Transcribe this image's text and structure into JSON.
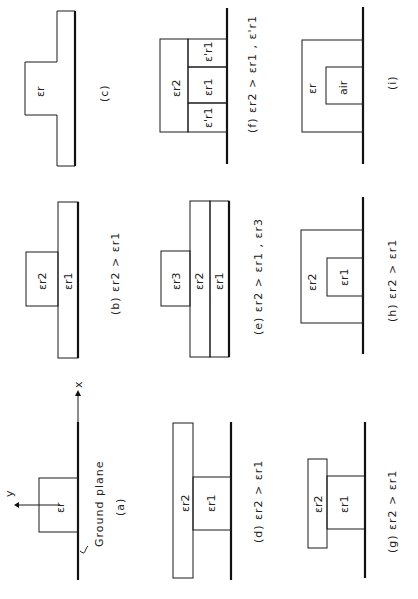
{
  "figure": {
    "orientation": "rotated 90deg counter-clockwise",
    "panels": {
      "a": {
        "caption": "(a)",
        "region_label": "εr",
        "ground_label": "Ground plane",
        "axis_x": "x",
        "axis_y": "y"
      },
      "b": {
        "caption": "(b)  εr2 > εr1",
        "labels": [
          "εr2",
          "εr1"
        ]
      },
      "c": {
        "caption": "(c)",
        "labels": [
          "εr"
        ]
      },
      "d": {
        "caption": "(d)  εr2 > εr1",
        "labels": [
          "εr2",
          "εr1"
        ]
      },
      "e": {
        "caption": "(e) εr2 > εr1 , εr3",
        "labels": [
          "εr3",
          "εr2",
          "εr1"
        ]
      },
      "f": {
        "caption": "(f)  εr2 > εr1 , ε'r1",
        "labels": [
          "εr2",
          "ε'r1",
          "εr1",
          "ε'r1"
        ]
      },
      "g": {
        "caption": "(g)   εr2 > εr1",
        "labels": [
          "εr2",
          "εr1"
        ]
      },
      "h": {
        "caption": "(h)   εr2 > εr1",
        "labels": [
          "εr2",
          "εr1"
        ]
      },
      "i": {
        "caption": "(i)",
        "labels": [
          "εr",
          "air"
        ]
      }
    }
  }
}
